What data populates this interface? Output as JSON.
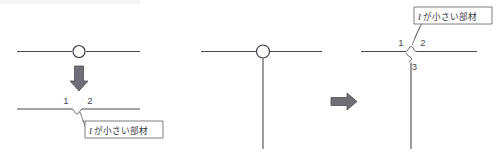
{
  "figure": {
    "colors": {
      "line": "#4a4a52",
      "squiggle": "#6b6b74",
      "arrow_fill": "#6e6e76",
      "arrow_stroke": "#4e4e56",
      "callout_stroke": "#6f6f78",
      "background": "#ffffff",
      "node_fill": "#ffffff"
    }
  },
  "left_panel": {
    "name": "beam-split-panel",
    "before": {
      "name": "straight-beam-with-node",
      "node_label": "",
      "description": "horizontal beam with single circular node at mid-span"
    },
    "transform_arrow": {
      "name": "down-arrow",
      "direction": "down",
      "glyph": "↓"
    },
    "after": {
      "name": "split-beam-with-gap",
      "segment_labels": [
        "1",
        "2"
      ],
      "description": "horizontal beam split into two segments separated by a small break symbol"
    },
    "callout": {
      "name": "small-i-member-callout",
      "text_italic": "I",
      "text_rest": "が小さい部材",
      "full_text": "I が小さい部材"
    }
  },
  "right_panel": {
    "name": "tee-joint-split-panel",
    "before": {
      "name": "tee-joint-with-node",
      "description": "horizontal beam meeting a vertical column with circular node at the junction"
    },
    "transform_arrow": {
      "name": "right-arrow",
      "direction": "right",
      "glyph": "→"
    },
    "after": {
      "name": "split-tee-joint",
      "segment_labels": [
        "1",
        "2",
        "3"
      ],
      "description": "tee joint split into three members separated by small break symbols"
    },
    "callout": {
      "name": "small-i-member-callout",
      "text_italic": "I",
      "text_rest": "が小さい部材",
      "full_text": "I が小さい部材"
    }
  }
}
